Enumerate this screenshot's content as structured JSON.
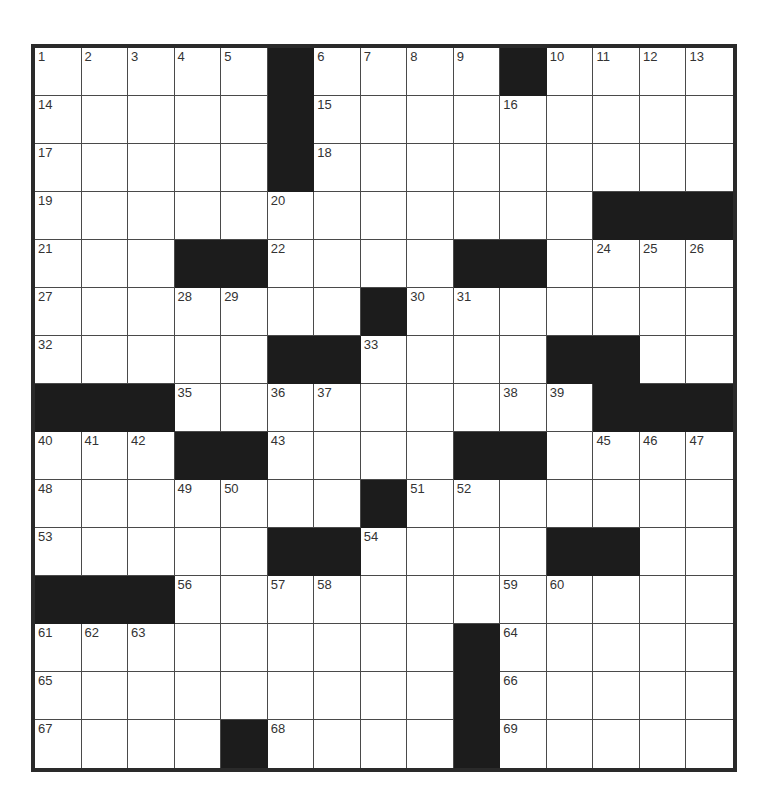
{
  "puzzle": {
    "rows": 15,
    "cols": 15,
    "colors": {
      "black_cell": "#1c1c1c",
      "white_cell": "#ffffff",
      "grid_line": "#4a4a4a",
      "border": "#2a2a2a",
      "number": "#333333"
    },
    "layout": [
      "#####B####B####",
      "#####B#########",
      "#####B#########",
      "############BBB",
      "###BB####BB####",
      "#######B#######",
      "#####BB####BB##",
      "BBB#########BBB",
      "###BB####BB####",
      "#######B#######",
      "#####BB####BB##",
      "BBB############",
      "#########B#####",
      "#########B#####",
      "####B####B#####"
    ],
    "numbers": [
      [
        1,
        0,
        0
      ],
      [
        2,
        0,
        1
      ],
      [
        3,
        0,
        2
      ],
      [
        4,
        0,
        3
      ],
      [
        5,
        0,
        4
      ],
      [
        6,
        0,
        6
      ],
      [
        7,
        0,
        7
      ],
      [
        8,
        0,
        8
      ],
      [
        9,
        0,
        9
      ],
      [
        10,
        0,
        11
      ],
      [
        11,
        0,
        12
      ],
      [
        12,
        0,
        13
      ],
      [
        13,
        0,
        14
      ],
      [
        14,
        1,
        0
      ],
      [
        15,
        1,
        6
      ],
      [
        16,
        1,
        10
      ],
      [
        17,
        2,
        0
      ],
      [
        18,
        2,
        6
      ],
      [
        19,
        3,
        0
      ],
      [
        20,
        3,
        5
      ],
      [
        21,
        4,
        0
      ],
      [
        22,
        4,
        5
      ],
      [
        23,
        4,
        10
      ],
      [
        24,
        4,
        12
      ],
      [
        25,
        4,
        13
      ],
      [
        26,
        4,
        14
      ],
      [
        27,
        5,
        0
      ],
      [
        28,
        5,
        3
      ],
      [
        29,
        5,
        4
      ],
      [
        30,
        5,
        8
      ],
      [
        31,
        5,
        9
      ],
      [
        32,
        6,
        0
      ],
      [
        33,
        6,
        7
      ],
      [
        34,
        6,
        12
      ],
      [
        35,
        7,
        3
      ],
      [
        36,
        7,
        5
      ],
      [
        37,
        7,
        6
      ],
      [
        38,
        7,
        10
      ],
      [
        39,
        7,
        11
      ],
      [
        40,
        8,
        0
      ],
      [
        41,
        8,
        1
      ],
      [
        42,
        8,
        2
      ],
      [
        43,
        8,
        5
      ],
      [
        44,
        8,
        10
      ],
      [
        45,
        8,
        12
      ],
      [
        46,
        8,
        13
      ],
      [
        47,
        8,
        14
      ],
      [
        48,
        9,
        0
      ],
      [
        49,
        9,
        3
      ],
      [
        50,
        9,
        4
      ],
      [
        51,
        9,
        8
      ],
      [
        52,
        9,
        9
      ],
      [
        53,
        10,
        0
      ],
      [
        54,
        10,
        7
      ],
      [
        55,
        10,
        12
      ],
      [
        56,
        11,
        3
      ],
      [
        57,
        11,
        5
      ],
      [
        58,
        11,
        6
      ],
      [
        59,
        11,
        10
      ],
      [
        60,
        11,
        11
      ],
      [
        61,
        12,
        0
      ],
      [
        62,
        12,
        1
      ],
      [
        63,
        12,
        2
      ],
      [
        64,
        12,
        10
      ],
      [
        65,
        13,
        0
      ],
      [
        66,
        13,
        10
      ],
      [
        67,
        14,
        0
      ],
      [
        68,
        14,
        5
      ],
      [
        69,
        14,
        10
      ]
    ]
  }
}
